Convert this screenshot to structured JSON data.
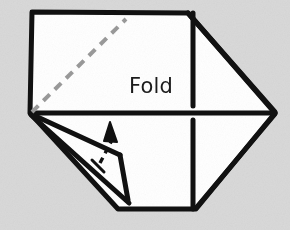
{
  "figure": {
    "kind": "paper-folding-diagram",
    "width": 290,
    "height": 230,
    "background_color": "#d9d9d9",
    "paper_fill": "#ffffff",
    "ink_color": "#111111",
    "crease_color": "#9a9a9a",
    "labels": {
      "fold": "Fold"
    },
    "annotations": {
      "fold_arrow": "fold-direction-arrow",
      "crease_line": "dashed-diagonal-crease",
      "tick_mark": "crease-tick-mark"
    },
    "outline_points": "32,12 188,13 275,113 196,209 118,209 30,113",
    "center_line_points": "31,113 275,113",
    "crease_dashes": "32,112 126,19",
    "right_panel_vertical_top": "193,13 193,106",
    "right_panel_vertical_bottom": "193,120 193,209",
    "top_right_diagonal": "188,13 275,112",
    "bottom_right_diagonal": "275,114 196,208",
    "flap_upper_edge": "31,114 120,155",
    "flap_lower_edge": "120,155 128,200",
    "flap_outer_edge": "31,115 129,203",
    "arrow_tail": "100,163 112,140",
    "arrow_head": "110,122 117,142 104,141",
    "tick_mark_line": "92,160 104,172"
  }
}
